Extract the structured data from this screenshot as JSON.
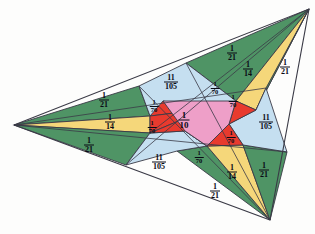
{
  "figure": {
    "name": "triangle-cevian-area-dissection",
    "title": "",
    "colors": {
      "green": "#4f9465",
      "yellow": "#f5d77a",
      "blue": "#c5dff0",
      "red": "#e83a2e",
      "pink": "#ee9fc8",
      "outline": "#3a3a46",
      "background": "#fdfdfc",
      "text": "#0a0a14"
    },
    "outer_triangle": {
      "vertices": [
        {
          "name": "left-vertex",
          "x": 14,
          "y": 125
        },
        {
          "name": "top-right-vertex",
          "x": 309,
          "y": 9
        },
        {
          "name": "bottom-right-vertex",
          "x": 270,
          "y": 220
        }
      ]
    },
    "regions": [
      {
        "id": "center",
        "label_num": "1",
        "label_den": "10",
        "color": "pink",
        "size": "big",
        "x": 184,
        "y": 120
      },
      {
        "id": "red-nw",
        "label_num": "1",
        "label_den": "70",
        "color": "red",
        "size": "sml",
        "x": 154,
        "y": 106
      },
      {
        "id": "red-w",
        "label_num": "1",
        "label_den": "70",
        "color": "red",
        "size": "sml",
        "x": 152,
        "y": 127
      },
      {
        "id": "red-n",
        "label_num": "1",
        "label_den": "70",
        "color": "red",
        "size": "sml",
        "x": 215,
        "y": 88
      },
      {
        "id": "red-ne",
        "label_num": "1",
        "label_den": "70",
        "color": "red",
        "size": "sml",
        "x": 233,
        "y": 101
      },
      {
        "id": "red-se",
        "label_num": "1",
        "label_den": "70",
        "color": "red",
        "size": "sml",
        "x": 231,
        "y": 137
      },
      {
        "id": "red-s",
        "label_num": "1",
        "label_den": "70",
        "color": "red",
        "size": "sml",
        "x": 199,
        "y": 157
      },
      {
        "id": "blue-top",
        "label_num": "11",
        "label_den": "105",
        "color": "blue",
        "size": "med",
        "x": 171,
        "y": 82
      },
      {
        "id": "blue-right",
        "label_num": "11",
        "label_den": "105",
        "color": "blue",
        "size": "med",
        "x": 266,
        "y": 122
      },
      {
        "id": "blue-bottom",
        "label_num": "11",
        "label_den": "105",
        "color": "blue",
        "size": "med",
        "x": 159,
        "y": 162
      },
      {
        "id": "green-tr-up",
        "label_num": "1",
        "label_den": "21",
        "color": "green",
        "size": "med",
        "x": 232,
        "y": 53
      },
      {
        "id": "yellow-tr",
        "label_num": "1",
        "label_den": "14",
        "color": "yellow",
        "size": "med",
        "x": 248,
        "y": 69
      },
      {
        "id": "green-tr-dn",
        "label_num": "1",
        "label_den": "21",
        "color": "green",
        "size": "med",
        "x": 285,
        "y": 67
      },
      {
        "id": "green-l-up",
        "label_num": "1",
        "label_den": "21",
        "color": "green",
        "size": "med",
        "x": 104,
        "y": 100
      },
      {
        "id": "yellow-l",
        "label_num": "1",
        "label_den": "14",
        "color": "yellow",
        "size": "med",
        "x": 110,
        "y": 122
      },
      {
        "id": "green-l-dn",
        "label_num": "1",
        "label_den": "21",
        "color": "green",
        "size": "med",
        "x": 89,
        "y": 145
      },
      {
        "id": "green-br-lf",
        "label_num": "1",
        "label_den": "21",
        "color": "green",
        "size": "med",
        "x": 215,
        "y": 191
      },
      {
        "id": "yellow-br",
        "label_num": "1",
        "label_den": "14",
        "color": "yellow",
        "size": "med",
        "x": 232,
        "y": 172
      },
      {
        "id": "green-br-rt",
        "label_num": "1",
        "label_den": "21",
        "color": "green",
        "size": "med",
        "x": 264,
        "y": 170
      }
    ]
  }
}
